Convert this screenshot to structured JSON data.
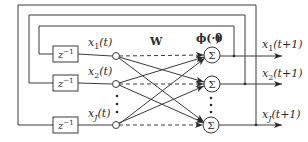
{
  "diagram": {
    "type": "recurrent-neural-network",
    "weight_label": "W",
    "activation_label": "ϕ(·)",
    "threshold_label": "θ",
    "delay_label": "z",
    "delay_exponent": "−1",
    "sum_symbol": "Σ",
    "inputs": [
      {
        "var": "x",
        "sub": "1",
        "arg": "(t)"
      },
      {
        "var": "x",
        "sub": "2",
        "arg": "(t)"
      },
      {
        "var": "x",
        "sub": "J",
        "arg": "(t)"
      }
    ],
    "outputs": [
      {
        "var": "x",
        "sub": "1",
        "arg": "(t+1)"
      },
      {
        "var": "x",
        "sub": "2",
        "arg": "(t+1)"
      },
      {
        "var": "x",
        "sub": "J",
        "arg": "(t+1)"
      }
    ],
    "ellipsis": "⋮",
    "colors": {
      "line": "#3a3a3a",
      "background": "#ffffff"
    }
  }
}
